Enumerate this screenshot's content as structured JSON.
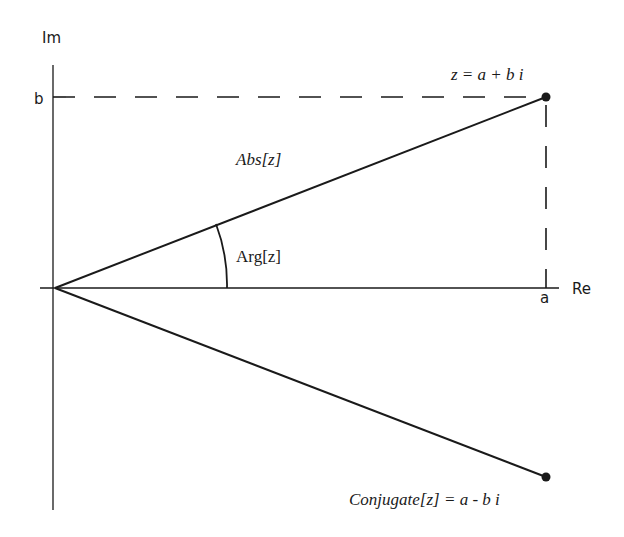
{
  "diagram": {
    "axes": {
      "imaginary_label": "Im",
      "real_label": "Re",
      "b_tick_label": "b",
      "a_tick_label": "a"
    },
    "labels": {
      "point_z": "z = a + b i",
      "modulus": "Abs[z]",
      "argument": "Arg[z]",
      "conjugate": "Conjugate[z] = a - b i"
    },
    "colors": {
      "ink": "#1a1a1a",
      "background": "#ffffff"
    }
  }
}
